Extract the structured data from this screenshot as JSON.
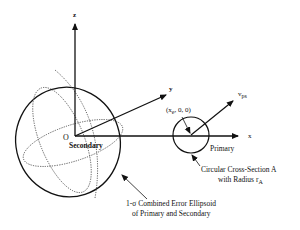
{
  "diagram": {
    "axes": {
      "z_label": "z",
      "y_label": "y",
      "x_label": "x",
      "origin_label": "O"
    },
    "secondary_label": "Secondary",
    "primary_label": "Primary",
    "position_label": {
      "prefix": "(x",
      "subscript": "e",
      "suffix": ", 0, 0)"
    },
    "velocity_label": {
      "base": "v",
      "subscript": "ps"
    },
    "cross_section": {
      "line1": "Circular Cross-Section A",
      "line2_prefix": "with Radius r",
      "line2_subscript": "A"
    },
    "ellipsoid": {
      "line1": "1-σ Combined Error Ellipsoid",
      "line2": "of Primary and Secondary"
    },
    "colors": {
      "ink": "#111111",
      "background": "#ffffff"
    }
  }
}
